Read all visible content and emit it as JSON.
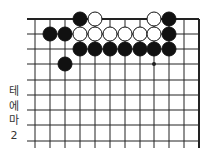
{
  "diagram": {
    "type": "go-board-fragment",
    "columns_x": [
      35,
      50,
      65,
      80,
      95,
      110,
      125,
      140,
      154,
      169,
      184,
      199
    ],
    "rows_y": [
      19,
      34,
      49,
      64,
      80,
      95,
      110,
      125,
      141
    ],
    "edges": {
      "top": true,
      "right": true,
      "left": false,
      "bottom": false
    },
    "star_points": [
      {
        "col": 8,
        "row": 3
      }
    ],
    "stones": [
      {
        "color": "black",
        "col": 3,
        "row": 0
      },
      {
        "color": "white",
        "col": 4,
        "row": 0
      },
      {
        "color": "white",
        "col": 8,
        "row": 0
      },
      {
        "color": "black",
        "col": 9,
        "row": 0
      },
      {
        "color": "black",
        "col": 1,
        "row": 1
      },
      {
        "color": "black",
        "col": 2,
        "row": 1
      },
      {
        "color": "white",
        "col": 3,
        "row": 1
      },
      {
        "color": "white",
        "col": 4,
        "row": 1
      },
      {
        "color": "white",
        "col": 5,
        "row": 1
      },
      {
        "color": "white",
        "col": 6,
        "row": 1
      },
      {
        "color": "white",
        "col": 7,
        "row": 1
      },
      {
        "color": "white",
        "col": 8,
        "row": 1
      },
      {
        "color": "black",
        "col": 9,
        "row": 1
      },
      {
        "color": "black",
        "col": 3,
        "row": 2
      },
      {
        "color": "black",
        "col": 4,
        "row": 2
      },
      {
        "color": "black",
        "col": 5,
        "row": 2
      },
      {
        "color": "black",
        "col": 6,
        "row": 2
      },
      {
        "color": "black",
        "col": 7,
        "row": 2
      },
      {
        "color": "black",
        "col": 8,
        "row": 2
      },
      {
        "color": "black",
        "col": 9,
        "row": 2
      },
      {
        "color": "black",
        "col": 2,
        "row": 3
      }
    ],
    "colors": {
      "line": "#222222",
      "black_stone": "#111111",
      "white_stone": "#ffffff",
      "stone_outline": "#111111"
    }
  },
  "caption": {
    "chars": [
      "테",
      "에",
      "마",
      "2"
    ]
  }
}
